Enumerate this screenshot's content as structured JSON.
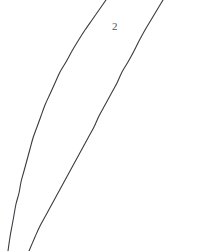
{
  "figure": {
    "width": 205,
    "height": 251,
    "background_color": "#ffffff",
    "stroke_color": "#3a3a42",
    "stroke_width": 1.1,
    "label_color": "#55555c"
  },
  "labels": [
    {
      "name": "curve-label-2",
      "text": "2",
      "x": 112,
      "y": 21,
      "font_size": 11
    }
  ],
  "chart_data": {
    "type": "line",
    "title": "",
    "subtitle": "",
    "xlabel": "",
    "ylabel": "",
    "grid": false,
    "legend": "none",
    "axes_visible": false,
    "tick_labels_x": [],
    "tick_labels_y": [],
    "xlim": [
      0,
      205
    ],
    "ylim": [
      0,
      251
    ],
    "annotations": [
      {
        "text": "2",
        "x": 112,
        "y": 21
      }
    ],
    "series": [
      {
        "name": "curve-left",
        "color": "#3a3a42",
        "width": 1.1,
        "points": [
          [
            106,
            0
          ],
          [
            99,
            10
          ],
          [
            92,
            20
          ],
          [
            85,
            30
          ],
          [
            78,
            41
          ],
          [
            72,
            51
          ],
          [
            66,
            62
          ],
          [
            60,
            72
          ],
          [
            55,
            83
          ],
          [
            50,
            94
          ],
          [
            45,
            105
          ],
          [
            41,
            116
          ],
          [
            37,
            127
          ],
          [
            33,
            138
          ],
          [
            30,
            149
          ],
          [
            27,
            160
          ],
          [
            24,
            171
          ],
          [
            21,
            182
          ],
          [
            19,
            193
          ],
          [
            16,
            204
          ],
          [
            14,
            215
          ],
          [
            12,
            226
          ],
          [
            10,
            237
          ],
          [
            8,
            251
          ]
        ]
      },
      {
        "name": "curve-right",
        "color": "#3a3a42",
        "width": 1.1,
        "points": [
          [
            163,
            0
          ],
          [
            157,
            10
          ],
          [
            151,
            20
          ],
          [
            145,
            30
          ],
          [
            139,
            41
          ],
          [
            134,
            51
          ],
          [
            128,
            62
          ],
          [
            122,
            72
          ],
          [
            117,
            83
          ],
          [
            111,
            94
          ],
          [
            105,
            105
          ],
          [
            99,
            116
          ],
          [
            94,
            127
          ],
          [
            88,
            138
          ],
          [
            82,
            149
          ],
          [
            76,
            160
          ],
          [
            70,
            171
          ],
          [
            64,
            182
          ],
          [
            58,
            193
          ],
          [
            52,
            204
          ],
          [
            46,
            215
          ],
          [
            40,
            226
          ],
          [
            35,
            237
          ],
          [
            29,
            251
          ]
        ]
      }
    ]
  }
}
